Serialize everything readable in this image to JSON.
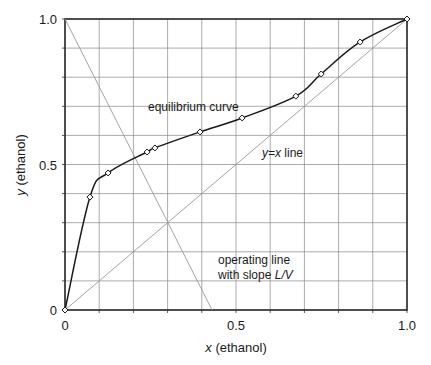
{
  "chart_data": {
    "type": "line",
    "title": "",
    "xlabel": "x (ethanol)",
    "ylabel": "y (ethanol)",
    "xlim": [
      0,
      1.0
    ],
    "ylim": [
      0,
      1.0
    ],
    "grid": true,
    "x_ticks": [
      "0",
      "0.5",
      "1.0"
    ],
    "y_ticks": [
      "0",
      "0.5",
      "1.0"
    ],
    "grid_step": 0.1,
    "series": [
      {
        "name": "equilibrium curve",
        "markers": "diamond",
        "x": [
          0,
          0.073,
          0.126,
          0.24,
          0.263,
          0.395,
          0.518,
          0.675,
          0.749,
          0.863,
          1.0
        ],
        "y": [
          0,
          0.388,
          0.471,
          0.543,
          0.557,
          0.612,
          0.66,
          0.735,
          0.811,
          0.921,
          1.0
        ]
      },
      {
        "name": "y=x line",
        "x": [
          0,
          1.0
        ],
        "y": [
          0,
          1.0
        ]
      },
      {
        "name": "operating line with slope L/V",
        "x": [
          0,
          0.43
        ],
        "y": [
          1.0,
          0
        ]
      }
    ],
    "annotations": [
      {
        "text": "equilibrium curve",
        "x": 0.33,
        "y": 0.68
      },
      {
        "text": "y=x line",
        "x": 0.6,
        "y": 0.53
      },
      {
        "text": "operating line",
        "x": 0.47,
        "y": 0.2
      },
      {
        "text": "with slope L/V",
        "x": 0.47,
        "y": 0.15
      }
    ]
  },
  "labels": {
    "x_axis": "(ethanol)",
    "x_axis_var": "x",
    "y_axis": "(ethanol)",
    "y_axis_var": "y",
    "tick_x0": "0",
    "tick_x05": "0.5",
    "tick_x1": "1.0",
    "tick_y0": "0",
    "tick_y05": "0.5",
    "tick_y1": "1.0",
    "eq_curve": "equilibrium curve",
    "yx_var": "y=x",
    "yx_text": " line",
    "op_line1": "operating line",
    "op_line2": "with slope ",
    "op_slope": "L/V"
  }
}
